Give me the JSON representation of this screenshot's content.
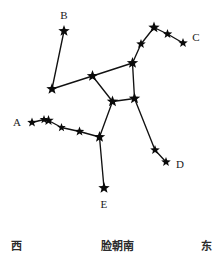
{
  "diagram": {
    "width": 219,
    "height": 261,
    "background_color": "#ffffff",
    "line_color": "#111111",
    "star_color": "#0a0a0a"
  },
  "chart_data": {
    "type": "scatter",
    "xlabel": "",
    "ylabel": "",
    "xlim": [
      0,
      219
    ],
    "ylim": [
      0,
      261
    ],
    "grid": false,
    "legend": "none",
    "stars": [
      {
        "id": "s1",
        "x": 64,
        "y": 31,
        "size": 6.0,
        "label": "B"
      },
      {
        "id": "s2",
        "x": 52,
        "y": 89,
        "size": 6.0,
        "label": ""
      },
      {
        "id": "s3",
        "x": 92.5,
        "y": 76,
        "size": 6.0,
        "label": ""
      },
      {
        "id": "s4",
        "x": 112.5,
        "y": 101.5,
        "size": 6.0,
        "label": ""
      },
      {
        "id": "s5",
        "x": 134.5,
        "y": 98.5,
        "size": 6.0,
        "label": ""
      },
      {
        "id": "s6",
        "x": 132.5,
        "y": 63,
        "size": 6.0,
        "label": ""
      },
      {
        "id": "s7",
        "x": 141,
        "y": 44,
        "size": 5.0,
        "label": ""
      },
      {
        "id": "s8",
        "x": 154,
        "y": 27.5,
        "size": 6.0,
        "label": ""
      },
      {
        "id": "s9",
        "x": 167.5,
        "y": 34,
        "size": 5.0,
        "label": ""
      },
      {
        "id": "s10",
        "x": 183,
        "y": 43,
        "size": 5.0,
        "label": "C"
      },
      {
        "id": "s11",
        "x": 155,
        "y": 150,
        "size": 5.0,
        "label": ""
      },
      {
        "id": "s12",
        "x": 166,
        "y": 162,
        "size": 5.0,
        "label": "D"
      },
      {
        "id": "s13",
        "x": 99.5,
        "y": 137,
        "size": 6.0,
        "label": ""
      },
      {
        "id": "s14",
        "x": 104,
        "y": 188,
        "size": 6.0,
        "label": "E"
      },
      {
        "id": "s15",
        "x": 79.5,
        "y": 131.5,
        "size": 5.0,
        "label": ""
      },
      {
        "id": "s16",
        "x": 61.5,
        "y": 127.5,
        "size": 4.5,
        "label": ""
      },
      {
        "id": "s17",
        "x": 48.5,
        "y": 120.5,
        "size": 5.5,
        "label": ""
      },
      {
        "id": "s18",
        "x": 44,
        "y": 119.5,
        "size": 4.5,
        "label": ""
      },
      {
        "id": "s19",
        "x": 32,
        "y": 122.5,
        "size": 5.0,
        "label": "A"
      }
    ],
    "connections": [
      [
        "s1",
        "s2"
      ],
      [
        "s2",
        "s3"
      ],
      [
        "s3",
        "s4"
      ],
      [
        "s4",
        "s5"
      ],
      [
        "s5",
        "s6"
      ],
      [
        "s6",
        "s3"
      ],
      [
        "s6",
        "s7"
      ],
      [
        "s7",
        "s8"
      ],
      [
        "s8",
        "s9"
      ],
      [
        "s9",
        "s10"
      ],
      [
        "s5",
        "s11"
      ],
      [
        "s11",
        "s12"
      ],
      [
        "s4",
        "s13"
      ],
      [
        "s13",
        "s14"
      ],
      [
        "s13",
        "s15"
      ],
      [
        "s15",
        "s16"
      ],
      [
        "s16",
        "s17"
      ],
      [
        "s17",
        "s18"
      ],
      [
        "s18",
        "s19"
      ]
    ],
    "labels": [
      {
        "text": "B",
        "x": 64,
        "y": 15
      },
      {
        "text": "C",
        "x": 196,
        "y": 37
      },
      {
        "text": "A",
        "x": 17,
        "y": 122
      },
      {
        "text": "D",
        "x": 180,
        "y": 164
      },
      {
        "text": "E",
        "x": 104,
        "y": 204
      }
    ],
    "compass_labels": [
      {
        "text": "西",
        "x": 16,
        "y": 246,
        "meaning": "west"
      },
      {
        "text": "脸朝南",
        "x": 117,
        "y": 246,
        "meaning": "face-south"
      },
      {
        "text": "东",
        "x": 206,
        "y": 246,
        "meaning": "east"
      }
    ]
  }
}
